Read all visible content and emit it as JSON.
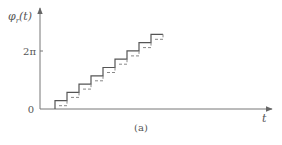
{
  "figure": {
    "caption": "(a)",
    "y_axis": {
      "label_main": "φ",
      "label_sub": "r",
      "label_arg": "(t)",
      "ticks": [
        {
          "label": "2π",
          "value": 6.283
        },
        {
          "label": "0",
          "value": 0
        }
      ]
    },
    "x_axis": {
      "label": "t"
    },
    "colors": {
      "axis": "#777777",
      "solid_staircase": "#555555",
      "dashed_staircase": "#888888",
      "text": "#555555"
    },
    "geometry": {
      "origin_x": 40,
      "origin_y": 109,
      "x_axis_end": 272,
      "y_axis_top": 6,
      "first_step_x": 55,
      "step_width": 12,
      "step_height": 8.3,
      "steps": 9,
      "dash_offset_x": 4,
      "dash_offset_y": 5,
      "two_pi_y": 51
    }
  },
  "chart_data": {
    "type": "line",
    "title": "",
    "xlabel": "t",
    "ylabel": "φr(t)",
    "series": [
      {
        "name": "solid staircase",
        "style": "solid",
        "description": "Step function of phase vs time, 9 equal steps, reaching above 2π",
        "steps": 9
      },
      {
        "name": "dashed staircase",
        "style": "dashed",
        "description": "Same step function delayed slightly in time and lower in phase",
        "steps": 9
      }
    ],
    "y_ticks": [
      "0",
      "2π"
    ],
    "grid": false
  }
}
